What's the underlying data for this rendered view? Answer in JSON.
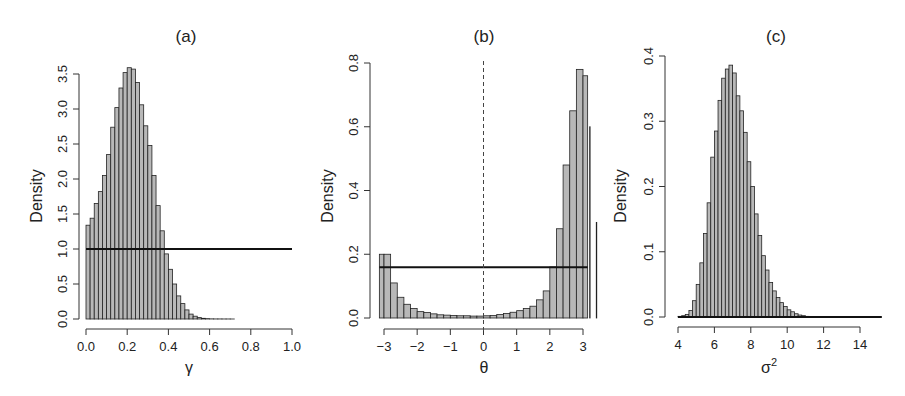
{
  "chart_data": [
    {
      "type": "bar",
      "panel": "a",
      "title": "(a)",
      "xlabel": "γ",
      "ylabel": "Density",
      "xlim": [
        0.0,
        1.0
      ],
      "ylim": [
        0.0,
        3.5
      ],
      "xticks": [
        "0.0",
        "0.2",
        "0.4",
        "0.6",
        "0.8",
        "1.0"
      ],
      "yticks": [
        "0.0",
        "0.5",
        "1.0",
        "1.5",
        "2.0",
        "2.5",
        "3.0",
        "3.5"
      ],
      "bin_width": 0.02,
      "bin_start": 0.0,
      "values": [
        1.34,
        1.44,
        1.65,
        1.82,
        2.05,
        2.35,
        2.74,
        3.02,
        3.3,
        3.52,
        3.59,
        3.57,
        3.38,
        3.06,
        2.76,
        2.48,
        2.05,
        1.62,
        1.26,
        0.93,
        0.71,
        0.5,
        0.33,
        0.22,
        0.13,
        0.07,
        0.04,
        0.02,
        0.01,
        0.005,
        0.002,
        0.001,
        0.001,
        0.0005,
        0.0005,
        0.0002
      ],
      "prior_line": {
        "y": 1.0,
        "x_from": 0.0,
        "x_to": 1.0
      },
      "grid": false
    },
    {
      "type": "bar",
      "panel": "b",
      "title": "(b)",
      "xlabel": "θ",
      "ylabel": "Density",
      "xlim": [
        -3.14,
        3.14
      ],
      "ylim": [
        0.0,
        0.8
      ],
      "xticks": [
        "-3",
        "-2",
        "-1",
        "0",
        "1",
        "2",
        "3"
      ],
      "yticks": [
        "0.0",
        "0.2",
        "0.4",
        "0.6",
        "0.8"
      ],
      "bin_width": 0.2,
      "bin_start": -3.2,
      "values": [
        0.2,
        0.2,
        0.11,
        0.065,
        0.043,
        0.03,
        0.02,
        0.017,
        0.013,
        0.01,
        0.009,
        0.008,
        0.007,
        0.007,
        0.006,
        0.006,
        0.007,
        0.008,
        0.011,
        0.014,
        0.018,
        0.023,
        0.03,
        0.037,
        0.057,
        0.085,
        0.16,
        0.28,
        0.48,
        0.65,
        0.78,
        0.76,
        0.6,
        0.3
      ],
      "prior_line": {
        "y": 0.159,
        "x_from": -3.14,
        "x_to": 3.14
      },
      "reference_line": {
        "x": 0,
        "style": "dashed"
      },
      "grid": false
    },
    {
      "type": "bar",
      "panel": "c",
      "title": "(c)",
      "xlabel": "σ²",
      "ylabel": "Density",
      "xlim": [
        4,
        15.2
      ],
      "ylim": [
        0.0,
        0.4
      ],
      "xticks": [
        "4",
        "6",
        "8",
        "10",
        "12",
        "14"
      ],
      "yticks": [
        "0.0",
        "0.1",
        "0.2",
        "0.3",
        "0.4"
      ],
      "bin_width": 0.2,
      "bin_start": 4.0,
      "values": [
        0.001,
        0.002,
        0.004,
        0.01,
        0.025,
        0.05,
        0.083,
        0.128,
        0.175,
        0.245,
        0.285,
        0.332,
        0.366,
        0.38,
        0.386,
        0.374,
        0.339,
        0.316,
        0.283,
        0.238,
        0.2,
        0.158,
        0.125,
        0.094,
        0.072,
        0.053,
        0.04,
        0.03,
        0.022,
        0.016,
        0.011,
        0.008,
        0.005,
        0.003,
        0.002,
        0.001,
        0.0008,
        0.0005,
        0.0003,
        0.0002
      ],
      "prior_line": {
        "y": 0.0,
        "x_from": 4.0,
        "x_to": 15.2
      },
      "grid": false
    }
  ],
  "panels": [
    {
      "title": "(a)",
      "ylabel": "Density",
      "xlabel_base": "γ",
      "xlabel_sup": ""
    },
    {
      "title": "(b)",
      "ylabel": "Density",
      "xlabel_base": "θ",
      "xlabel_sup": ""
    },
    {
      "title": "(c)",
      "ylabel": "Density",
      "xlabel_base": "σ",
      "xlabel_sup": "2"
    }
  ],
  "colors": {
    "bar_fill": "#b8b8b8",
    "bar_stroke": "#222222",
    "line": "#111111",
    "background": "#ffffff"
  }
}
